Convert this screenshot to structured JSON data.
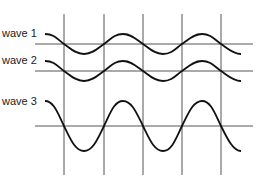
{
  "diagram": {
    "title": "",
    "labels": {
      "wave1": "wave 1",
      "wave2": "wave 2",
      "wave3": "wave 3"
    },
    "colors": {
      "grid": "#555555",
      "wave": "#111111",
      "text": "#222222"
    },
    "vertical_lines_x": [
      64,
      104,
      143,
      182,
      221
    ],
    "waves": [
      {
        "name": "wave 1",
        "axis_y": 44,
        "amplitude": 10,
        "relative_phase": "in phase"
      },
      {
        "name": "wave 2",
        "axis_y": 71,
        "amplitude": 10,
        "relative_phase": "in phase"
      },
      {
        "name": "wave 3",
        "axis_y": 126,
        "amplitude": 25,
        "relative_phase": "in phase"
      }
    ]
  }
}
